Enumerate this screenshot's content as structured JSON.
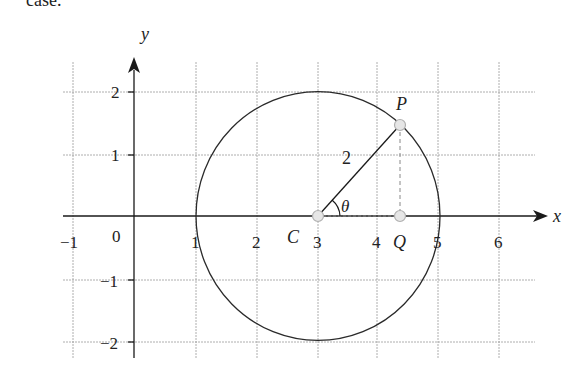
{
  "top_text": "case.",
  "diagram": {
    "type": "coordinate-plane-circle",
    "axes": {
      "x_label": "x",
      "y_label": "y",
      "x_ticks": [
        "−1",
        "0",
        "1",
        "2",
        "3",
        "4",
        "5",
        "6"
      ],
      "y_ticks": [
        "2",
        "1",
        "−1",
        "−2"
      ]
    },
    "circle": {
      "center_label": "C",
      "center": [
        3,
        0
      ],
      "radius": 2,
      "radius_label": "2"
    },
    "points": {
      "P": {
        "label": "P"
      },
      "Q": {
        "label": "Q"
      },
      "C": {
        "label": "C"
      }
    },
    "angle_label": "θ",
    "colors": {
      "grid": "#9a9a9a",
      "axis": "#1a1a1a",
      "point_fill": "#e6e6e6",
      "point_stroke": "#b0b0b0"
    }
  }
}
